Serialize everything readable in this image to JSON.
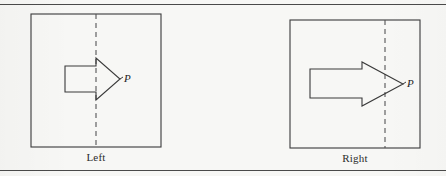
{
  "figure": {
    "background_color": "#f7f7f5",
    "ink_color": "#3a3a3a",
    "rule_color": "#4a4a4a",
    "dashed_color": "#555555",
    "top_rule": true,
    "bottom_rule": true
  },
  "panels": [
    {
      "id": "left",
      "caption": "Left",
      "force_label": "P",
      "box": {
        "x": 31,
        "y": 14,
        "width": 130,
        "height": 133
      },
      "dashed_line_x": 96,
      "arrow": {
        "direction": "right",
        "body_left_x": 65,
        "head_base_x": 96,
        "tip_x": 120,
        "tip_y": 79,
        "body_top_y": 66,
        "body_bottom_y": 92,
        "head_top_y": 58,
        "head_bottom_y": 100,
        "crosses_dashed_line": false
      }
    },
    {
      "id": "right",
      "caption": "Right",
      "force_label": "P",
      "box": {
        "x": 290,
        "y": 20,
        "width": 130,
        "height": 128
      },
      "dashed_line_x": 385,
      "arrow": {
        "direction": "right",
        "body_left_x": 310,
        "head_base_x": 362,
        "tip_x": 403,
        "tip_y": 84,
        "body_top_y": 69,
        "body_bottom_y": 98,
        "head_top_y": 62,
        "head_bottom_y": 106,
        "crosses_dashed_line": true
      }
    }
  ]
}
